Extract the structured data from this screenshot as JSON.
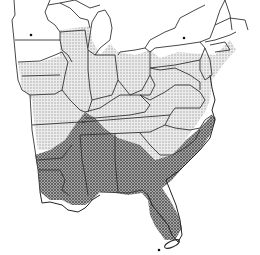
{
  "map": {
    "type": "species-range-map",
    "region": "Eastern United States",
    "colors": {
      "background": "#ffffff",
      "border": "#333333",
      "light_range": "#d6d6d6",
      "dark_range": "#8f8f8f"
    },
    "legend": {
      "light_zone": "light stippled range (northern/central)",
      "dark_zone": "dark stippled range (southern)"
    },
    "zones": [
      {
        "id": "light",
        "label": "light-shaded range"
      },
      {
        "id": "dark",
        "label": "dark-shaded range"
      }
    ],
    "points": [
      {
        "id": "dot-minnesota",
        "x": 31,
        "y": 35
      },
      {
        "id": "dot-new-york",
        "x": 184,
        "y": 38
      },
      {
        "id": "dot-kentucky",
        "x": 85,
        "y": 122
      },
      {
        "id": "dot-florida-keys",
        "x": 159,
        "y": 250
      }
    ]
  }
}
